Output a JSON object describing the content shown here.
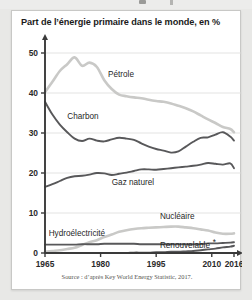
{
  "card": {
    "title": "Part de l’énergie primaire dans le monde, en %",
    "source": "Source : d’après Key World Energy Statistic, 2017."
  },
  "chart_data": {
    "type": "line",
    "title": "Part de l’énergie primaire dans le monde, en %",
    "xlabel": "",
    "ylabel": "",
    "xlim": [
      1965,
      2016
    ],
    "ylim": [
      0,
      52
    ],
    "yticks": [
      0,
      10,
      20,
      30,
      40,
      50
    ],
    "xticks": [
      1965,
      1980,
      1995,
      2010,
      2016
    ],
    "grid": true,
    "legend_position": "inline-labels",
    "colors": {
      "light": "#c9c9c7",
      "dark": "#58585a",
      "axis": "#3a3a3a",
      "gridline": "#dcdcda"
    },
    "x": [
      1965,
      1967,
      1969,
      1971,
      1973,
      1975,
      1977,
      1979,
      1981,
      1983,
      1985,
      1987,
      1989,
      1991,
      1993,
      1995,
      1997,
      1999,
      2001,
      2003,
      2005,
      2007,
      2009,
      2011,
      2013,
      2015,
      2016
    ],
    "series": [
      {
        "name": "Pétrole",
        "style": "light",
        "values": [
          40.2,
          42.8,
          45.5,
          47.2,
          48.9,
          46.8,
          47.6,
          46.5,
          43.2,
          41.0,
          39.6,
          39.2,
          38.9,
          38.7,
          38.3,
          38.0,
          37.8,
          37.4,
          36.8,
          36.2,
          35.4,
          34.4,
          33.4,
          32.5,
          31.5,
          31.0,
          30.2
        ]
      },
      {
        "name": "Charbon",
        "style": "dark",
        "values": [
          37.8,
          34.6,
          32.1,
          30.2,
          28.6,
          28.0,
          28.6,
          28.1,
          27.9,
          28.4,
          28.8,
          28.6,
          28.3,
          27.4,
          26.6,
          26.0,
          25.6,
          25.1,
          25.4,
          26.6,
          27.8,
          28.8,
          28.9,
          29.6,
          30.2,
          29.1,
          28.1
        ]
      },
      {
        "name": "Gaz naturel",
        "style": "dark",
        "values": [
          16.5,
          17.2,
          18.0,
          18.8,
          19.2,
          19.3,
          19.6,
          20.0,
          19.9,
          19.5,
          19.8,
          20.1,
          20.5,
          20.9,
          20.9,
          20.8,
          21.0,
          21.2,
          21.4,
          21.6,
          21.8,
          22.1,
          22.5,
          22.3,
          22.1,
          22.4,
          21.2
        ]
      },
      {
        "name": "Nucléaire",
        "style": "light",
        "values": [
          0.3,
          0.5,
          0.7,
          1.0,
          1.3,
          2.0,
          2.7,
          3.2,
          4.0,
          4.6,
          5.3,
          5.7,
          6.0,
          6.2,
          6.3,
          6.4,
          6.5,
          6.6,
          6.6,
          6.4,
          6.2,
          5.9,
          5.6,
          5.1,
          4.8,
          4.8,
          4.9
        ]
      },
      {
        "name": "Hydroélectricité",
        "style": "dark",
        "values": [
          2.1,
          2.1,
          2.1,
          2.1,
          2.1,
          2.2,
          2.2,
          2.2,
          2.3,
          2.3,
          2.3,
          2.3,
          2.3,
          2.2,
          2.2,
          2.2,
          2.2,
          2.2,
          2.2,
          2.2,
          2.2,
          2.2,
          2.4,
          2.4,
          2.5,
          2.6,
          2.7
        ]
      },
      {
        "name": "Renouvelable",
        "style": "dark",
        "values": [
          0.0,
          0.0,
          0.0,
          0.0,
          0.0,
          0.0,
          0.0,
          0.0,
          0.0,
          0.0,
          0.0,
          0.0,
          0.1,
          0.1,
          0.1,
          0.2,
          0.2,
          0.3,
          0.3,
          0.4,
          0.5,
          0.7,
          0.9,
          1.1,
          1.4,
          1.6,
          1.8
        ]
      }
    ],
    "annotations": [
      {
        "text": "Pétrole",
        "x": 1982,
        "y": 44.0
      },
      {
        "text": "Charbon",
        "x": 1971,
        "y": 33.5
      },
      {
        "text": "Gaz naturel",
        "x": 1983,
        "y": 17.0
      },
      {
        "text": "Nucléaire",
        "x": 1996,
        "y": 8.6
      },
      {
        "text": "Hydroélectricité",
        "x": 1966,
        "y": 4.3
      },
      {
        "text": "Renouvelable",
        "x": 1996,
        "y": 1.2
      }
    ]
  },
  "ytick_labels": [
    "0",
    "10",
    "20",
    "30",
    "40",
    "50"
  ],
  "xtick_labels": [
    "1965",
    "1980",
    "1995",
    "2010",
    "2016"
  ]
}
